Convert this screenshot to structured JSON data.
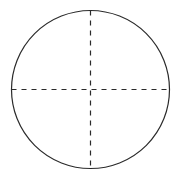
{
  "figure": {
    "name": "circle-with-dashed-diameters",
    "canvas": {
      "width": 180,
      "height": 177,
      "background_color": "#ffffff"
    },
    "circle": {
      "label": "circle-outline",
      "center_x": 90.5,
      "center_y": 89.5,
      "radius": 79,
      "stroke_color": "#2b2b2b",
      "stroke_width": 1.2,
      "stroke_style": "solid",
      "fill": "none"
    },
    "axes": [
      {
        "label": "vertical-diameter",
        "orientation": "vertical",
        "x1": 90.5,
        "y1": 10.5,
        "x2": 90.5,
        "y2": 168.5,
        "stroke_color": "#2b2b2b",
        "stroke_width": 1.2,
        "stroke_style": "dashed",
        "dash_length": 5,
        "gap_length": 5
      },
      {
        "label": "horizontal-diameter",
        "orientation": "horizontal",
        "x1": 11.5,
        "y1": 89.5,
        "x2": 169.5,
        "y2": 89.5,
        "stroke_color": "#2b2b2b",
        "stroke_width": 1.2,
        "stroke_style": "dashed",
        "dash_length": 5,
        "gap_length": 5
      }
    ],
    "center_point": {
      "label": "center-intersection",
      "x": 90.5,
      "y": 89.5
    },
    "annotations": [],
    "title": "",
    "caption": ""
  }
}
